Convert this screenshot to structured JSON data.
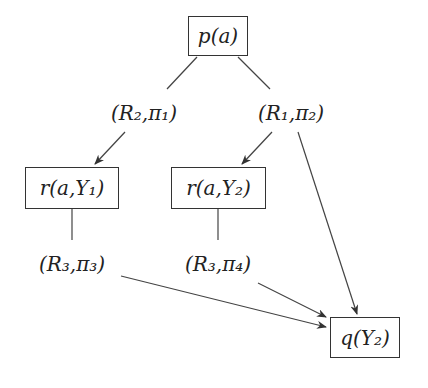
{
  "diagram": {
    "nodes": [
      {
        "id": "p",
        "text": "p(a)",
        "boxed": true
      },
      {
        "id": "r1",
        "text": "r(a,Y₁)",
        "boxed": true
      },
      {
        "id": "r2",
        "text": "r(a,Y₂)",
        "boxed": true
      },
      {
        "id": "q",
        "text": "q(Y₂)",
        "boxed": true
      }
    ],
    "labels": [
      {
        "id": "l1",
        "text": "(R₂,π₁)"
      },
      {
        "id": "l2",
        "text": "(R₁,π₂)"
      },
      {
        "id": "l3",
        "text": "(R₃,π₃)"
      },
      {
        "id": "l4",
        "text": "(R₃,π₄)"
      }
    ],
    "edges": [
      {
        "from": "p",
        "to": "l1",
        "arrow": false
      },
      {
        "from": "p",
        "to": "l2",
        "arrow": false
      },
      {
        "from": "l1",
        "to": "r1",
        "arrow": true
      },
      {
        "from": "l2",
        "to": "r2",
        "arrow": true
      },
      {
        "from": "l2",
        "to": "q",
        "arrow": true
      },
      {
        "from": "r1",
        "to": "l3",
        "arrow": false
      },
      {
        "from": "r2",
        "to": "l4",
        "arrow": false
      },
      {
        "from": "l3",
        "to": "q",
        "arrow": true
      },
      {
        "from": "l4",
        "to": "q",
        "arrow": true
      }
    ]
  }
}
